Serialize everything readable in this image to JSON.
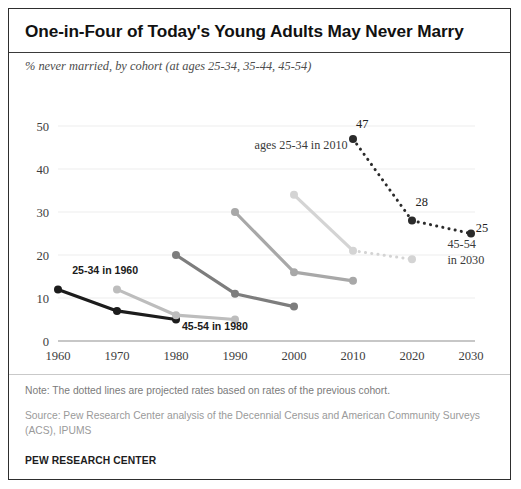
{
  "header": {
    "title": "One-in-Four  of Today's Young Adults May Never Marry",
    "subtitle": "% never married, by cohort (at ages 25-34, 35-44, 45-54)"
  },
  "footer": {
    "note": "Note: The dotted lines are projected rates based on rates of the previous cohort.",
    "source": "Source: Pew Research Center analysis of the Decennial Census and American Community Surveys (ACS), IPUMS",
    "brand": "PEW RESEARCH CENTER"
  },
  "chart_data": {
    "type": "line",
    "title": "One-in-Four  of Today's Young Adults May Never Marry",
    "subtitle": "% never married, by cohort (at ages 25-34, 35-44, 45-54)",
    "xlabel": "",
    "ylabel": "",
    "x": [
      1960,
      1970,
      1980,
      1990,
      2000,
      2010,
      2020,
      2030
    ],
    "xtick_labels": [
      "1960",
      "1970",
      "1980",
      "1990",
      "2000",
      "2010",
      "2020",
      "2030"
    ],
    "xlim": [
      1960,
      2030
    ],
    "ylim": [
      0,
      50
    ],
    "ytick_labels": [
      "0",
      "10",
      "20",
      "30",
      "40",
      "50"
    ],
    "yticks": [
      0,
      10,
      20,
      30,
      40,
      50
    ],
    "grid": "horizontal",
    "legend_position": "inline-annotations",
    "series": [
      {
        "name": "cohort-1960",
        "color": "#1c1c1c",
        "x": [
          1960,
          1970,
          1980
        ],
        "values": [
          12,
          7,
          5
        ],
        "projected_from": null
      },
      {
        "name": "cohort-1970",
        "color": "#bdbdbd",
        "x": [
          1970,
          1980,
          1990
        ],
        "values": [
          12,
          6,
          5
        ],
        "projected_from": null
      },
      {
        "name": "cohort-1980",
        "color": "#7d7d7d",
        "x": [
          1980,
          1990,
          2000
        ],
        "values": [
          20,
          11,
          8
        ],
        "projected_from": null
      },
      {
        "name": "cohort-1990",
        "color": "#a8a8a8",
        "x": [
          1990,
          2000,
          2010
        ],
        "values": [
          30,
          16,
          14
        ],
        "projected_from": null
      },
      {
        "name": "cohort-2000",
        "color": "#d4d4d4",
        "x": [
          2000,
          2010,
          2020
        ],
        "values": [
          34,
          21,
          19
        ],
        "projected_from": 2010
      },
      {
        "name": "cohort-2010",
        "color": "#2b2b2b",
        "x": [
          2010,
          2020,
          2030
        ],
        "values": [
          47,
          28,
          25
        ],
        "projected_from": 2010
      }
    ],
    "annotations": [
      {
        "name": "label-25-34-in-1960",
        "text": "25-34 in 1960",
        "x": 1962.4,
        "y": 15.6,
        "anchor": "start",
        "style": "series"
      },
      {
        "name": "label-45-54-in-1980",
        "text": "45-54 in 1980",
        "x": 1981.0,
        "y": 2.6,
        "anchor": "start",
        "style": "series"
      },
      {
        "name": "label-ages-25-34-in-2010",
        "text": "ages 25-34 in 2010",
        "x": 2009.1,
        "y": 44.6,
        "anchor": "end",
        "style": "annot"
      },
      {
        "name": "value-label-47",
        "text": "47",
        "x": 2010.5,
        "y": 49.6,
        "anchor": "start",
        "style": "value"
      },
      {
        "name": "value-label-28",
        "text": "28",
        "x": 2020.6,
        "y": 31.4,
        "anchor": "start",
        "style": "value"
      },
      {
        "name": "value-label-25",
        "text": "25",
        "x": 2030.8,
        "y": 25.4,
        "anchor": "start",
        "style": "value"
      },
      {
        "name": "label-45-54-in-2030-line1",
        "text": "45-54",
        "x": 2026.0,
        "y": 21.6,
        "anchor": "start",
        "style": "annot"
      },
      {
        "name": "label-45-54-in-2030-line2",
        "text": "in 2030",
        "x": 2026.0,
        "y": 18.0,
        "anchor": "start",
        "style": "annot"
      }
    ]
  }
}
